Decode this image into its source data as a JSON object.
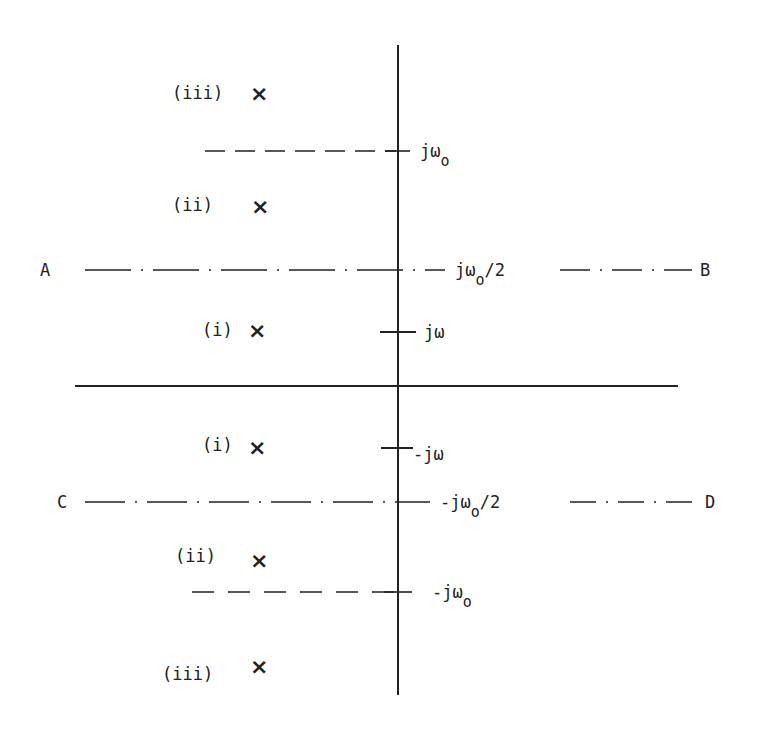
{
  "diagram": {
    "type": "s-plane pole diagram",
    "axes": {
      "vertical": {
        "x": 398,
        "y1": 45,
        "y2": 695
      },
      "horizontal": {
        "y": 386,
        "x1": 75,
        "x2": 678
      }
    },
    "lines": {
      "upper_dashed": {
        "label": "jω",
        "subscript": "o",
        "y": 151
      },
      "lower_dashed": {
        "label": "-jω",
        "subscript": "o",
        "y": 592
      },
      "upper_dashdot": {
        "left_label": "A",
        "right_label": "B",
        "center_label": "jω",
        "subscript": "o",
        "suffix": "/2",
        "y": 270
      },
      "lower_dashdot": {
        "left_label": "C",
        "right_label": "D",
        "center_label": "-jω",
        "subscript": "o",
        "suffix": "/2",
        "y": 502
      }
    },
    "ticks": [
      {
        "label": "jω",
        "y": 332
      },
      {
        "label": "-jω",
        "y": 448
      }
    ],
    "poles": [
      {
        "label": "(iii)",
        "marker": "×",
        "y": 93
      },
      {
        "label": "(ii)",
        "marker": "×",
        "y": 205
      },
      {
        "label": "(i)",
        "marker": "×",
        "y": 330
      },
      {
        "label": "(i)",
        "marker": "×",
        "y": 447
      },
      {
        "label": "(ii)",
        "marker": "×",
        "y": 560
      },
      {
        "label": "(iii)",
        "marker": "×",
        "y": 668
      }
    ],
    "colors": {
      "ink": "#222222",
      "background": "#ffffff"
    }
  }
}
